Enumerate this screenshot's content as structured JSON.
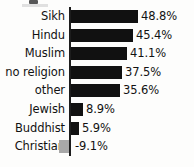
{
  "chart_data": {
    "type": "bar",
    "orientation": "horizontal",
    "title": "",
    "subtitle": "",
    "xlabel": "",
    "ylabel": "",
    "grid": false,
    "legend": null,
    "axis_zero_at_px": 70,
    "px_per_percent": 1.37,
    "xlim": [
      -9.1,
      48.8
    ],
    "categories": [
      "Sikh",
      "Hindu",
      "Muslim",
      "no religion",
      "other",
      "Jewish",
      "Buddhist",
      "Christian"
    ],
    "values": [
      48.8,
      45.4,
      41.1,
      37.5,
      35.6,
      8.9,
      5.9,
      -9.1
    ],
    "data_labels": [
      "48.8%",
      "45.4%",
      "41.1%",
      "37.5%",
      "35.6%",
      "8.9%",
      "5.9%",
      "-9.1%"
    ],
    "bar_colors": [
      "#111111",
      "#111111",
      "#111111",
      "#111111",
      "#111111",
      "#111111",
      "#111111",
      "#a8a8a8"
    ]
  },
  "rows": [
    {
      "category": "Sikh",
      "label": "48.8%",
      "bar_px": 67,
      "neg": false
    },
    {
      "category": "Hindu",
      "label": "45.4%",
      "bar_px": 62,
      "neg": false
    },
    {
      "category": "Muslim",
      "label": "41.1%",
      "bar_px": 56,
      "neg": false
    },
    {
      "category": "no religion",
      "label": "37.5%",
      "bar_px": 51,
      "neg": false
    },
    {
      "category": "other",
      "label": "35.6%",
      "bar_px": 49,
      "neg": false
    },
    {
      "category": "Jewish",
      "label": "8.9%",
      "bar_px": 12,
      "neg": false
    },
    {
      "category": "Buddhist",
      "label": "5.9%",
      "bar_px": 8,
      "neg": false
    },
    {
      "category": "Christian",
      "label": "-9.1%",
      "bar_px": 10,
      "neg": true
    }
  ]
}
